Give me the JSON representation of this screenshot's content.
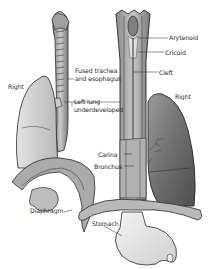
{
  "diagram": {
    "left_figure": {
      "labels": {
        "right": "Right",
        "fused_line1": "Fused trachea",
        "fused_line2": "and esophagus",
        "left_lung_line1": "Left lung",
        "left_lung_line2": "underdeveloped",
        "diaphragm": "Diaphragm"
      }
    },
    "right_figure": {
      "labels": {
        "arytenoid": "Arytenoid",
        "cricoid": "Cricoid",
        "cleft": "Cleft",
        "right": "Right",
        "carina": "Carina",
        "bronchus": "Bronchus",
        "stomach": "Stomach"
      }
    },
    "colors": {
      "ink": "#2a2a2a",
      "lung_dark": "#6b6b6b",
      "lung_mid": "#9a9a9a",
      "light": "#d9d9d9",
      "background": "#ffffff"
    }
  }
}
